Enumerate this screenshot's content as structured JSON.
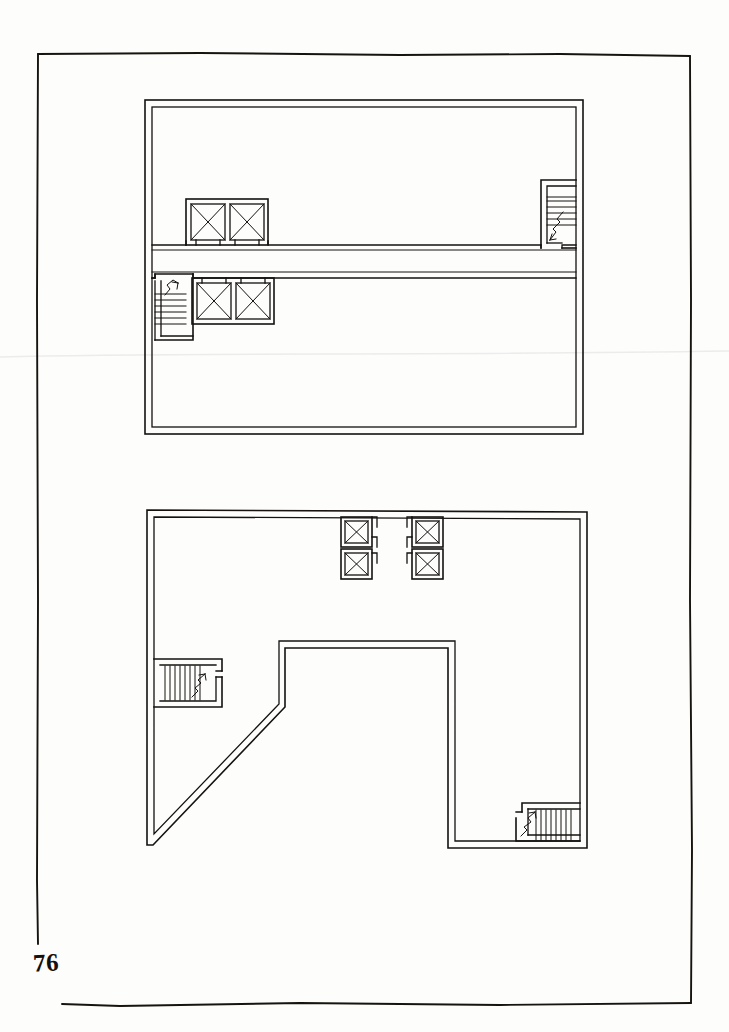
{
  "sheet": {
    "page_number": "76",
    "width": 729,
    "height": 1032,
    "paper_color": "#fdfdfc",
    "ink_color": "#15120f",
    "border": {
      "name": "hand-drawn-page-border",
      "left_x": 37,
      "top_y": 54,
      "right_x": 690,
      "bottom_y": 1004
    },
    "fold_line": {
      "name": "paper-fold-crease",
      "y": 356,
      "color": "#e8e8e6"
    }
  },
  "drawing": {
    "type": "architectural-floor-plan",
    "medium": "ink-on-paper",
    "plans": [
      {
        "id": "upper-plan",
        "label": "Upper floor plan",
        "shape": "rectangle",
        "outline": {
          "x": 145,
          "y": 100,
          "width": 438,
          "height": 334,
          "wall_thickness": 7
        },
        "corridor": {
          "name": "central-corridor",
          "y_top": 245,
          "y_bottom": 278,
          "x_start": 152,
          "x_end": 576,
          "wall_thickness": 4
        },
        "elevators": [
          {
            "id": "upper-elev-1",
            "x": 186,
            "y": 199,
            "w": 39,
            "h": 42,
            "door_side": "bottom"
          },
          {
            "id": "upper-elev-2",
            "x": 229,
            "y": 199,
            "w": 39,
            "h": 42,
            "door_side": "bottom"
          },
          {
            "id": "upper-elev-3",
            "x": 192,
            "y": 281,
            "w": 39,
            "h": 42,
            "door_side": "top"
          },
          {
            "id": "upper-elev-4",
            "x": 235,
            "y": 281,
            "w": 39,
            "h": 42,
            "door_side": "top"
          }
        ],
        "stairs": [
          {
            "id": "upper-stair-right",
            "x": 541,
            "y": 180,
            "w": 38,
            "h": 67,
            "tread_direction": "horizontal",
            "tread_count": 7,
            "arrow": "up-right"
          },
          {
            "id": "upper-stair-left",
            "x": 155,
            "y": 278,
            "w": 38,
            "h": 62,
            "tread_direction": "horizontal",
            "tread_count": 7,
            "arrow": "up-right"
          }
        ]
      },
      {
        "id": "lower-plan",
        "label": "Lower floor plan",
        "shape": "irregular-with-diagonal-cutout",
        "outline": {
          "x": 147,
          "y": 510,
          "width": 440,
          "height": 338,
          "wall_thickness": 6
        },
        "cutout": {
          "name": "diagonal-courtyard-cutout",
          "notch_top_y": 648,
          "notch_left_x": 285,
          "notch_right_x": 448,
          "diagonal_start_x": 285,
          "diagonal_start_y": 707,
          "diagonal_end_x": 153,
          "diagonal_end_y": 845
        },
        "elevators": [
          {
            "id": "lower-elev-1",
            "x": 342,
            "y": 517,
            "w": 29,
            "h": 29,
            "door_side": "right-bottom"
          },
          {
            "id": "lower-elev-2",
            "x": 342,
            "y": 549,
            "w": 29,
            "h": 29,
            "door_side": "right-top"
          },
          {
            "id": "lower-elev-3",
            "x": 413,
            "y": 517,
            "w": 29,
            "h": 29,
            "door_side": "left-bottom"
          },
          {
            "id": "lower-elev-4",
            "x": 413,
            "y": 549,
            "w": 29,
            "h": 29,
            "door_side": "left-top"
          }
        ],
        "stairs": [
          {
            "id": "lower-stair-left",
            "x": 157,
            "y": 659,
            "w": 62,
            "h": 38,
            "tread_direction": "vertical",
            "tread_count": 9,
            "arrow": "up-right"
          },
          {
            "id": "lower-stair-bottom-right",
            "x": 519,
            "y": 803,
            "w": 58,
            "h": 38,
            "tread_direction": "vertical",
            "tread_count": 9,
            "arrow": "up-right"
          }
        ]
      }
    ],
    "legend_symbols": {
      "elevator": "square-with-x-diagonals",
      "stair": "parallel-treads-with-direction-arrow",
      "wall": "double-line-poche"
    }
  }
}
